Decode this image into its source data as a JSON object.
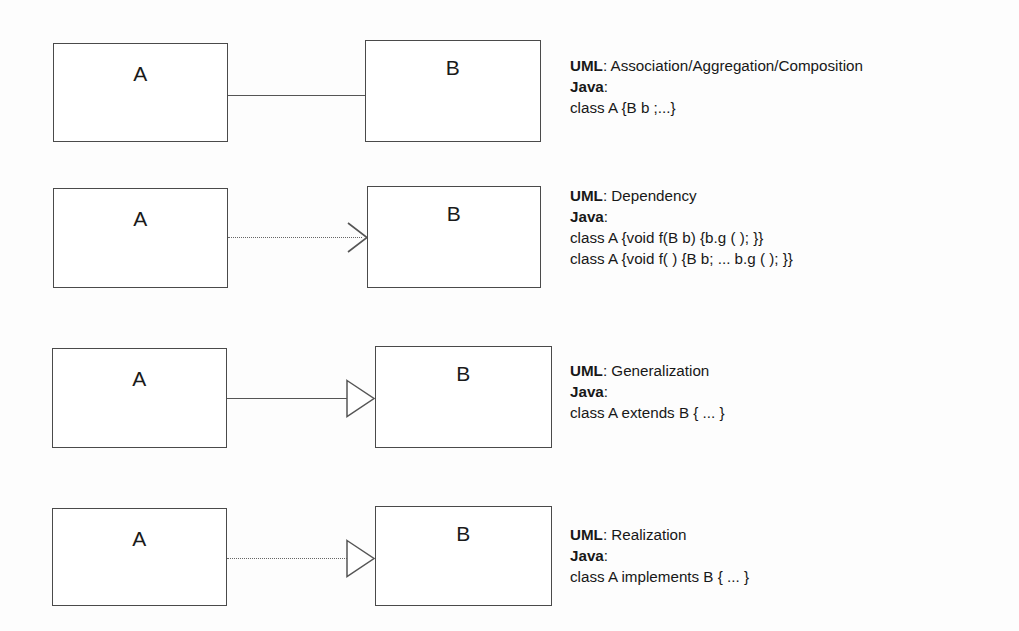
{
  "diagram": {
    "type": "uml-class-relationship-reference",
    "class_names": {
      "source": "A",
      "target": "B"
    },
    "rows": [
      {
        "id": "association",
        "source_label": "A",
        "target_label": "B",
        "connector": {
          "style": "solid",
          "arrowhead": "none"
        },
        "annotation": {
          "uml_key": "UML",
          "uml_sep": ": ",
          "uml_value": "Association/Aggregation/Composition",
          "java_key": "Java",
          "java_sep": ":",
          "code_lines": [
            "class A {B b ;...}"
          ]
        }
      },
      {
        "id": "dependency",
        "source_label": "A",
        "target_label": "B",
        "connector": {
          "style": "dotted",
          "arrowhead": "open"
        },
        "annotation": {
          "uml_key": "UML",
          "uml_sep": ": ",
          "uml_value": "Dependency",
          "java_key": "Java",
          "java_sep": ":",
          "code_lines": [
            "class A {void f(B b) {b.g ( ); }}",
            "class A {void f( ) {B b; ... b.g ( ); }}"
          ]
        }
      },
      {
        "id": "generalization",
        "source_label": "A",
        "target_label": "B",
        "connector": {
          "style": "solid",
          "arrowhead": "hollow-triangle"
        },
        "annotation": {
          "uml_key": "UML",
          "uml_sep": ": ",
          "uml_value": "Generalization",
          "java_key": "Java",
          "java_sep": ":",
          "code_lines": [
            "class A extends B { ... }"
          ]
        }
      },
      {
        "id": "realization",
        "source_label": "A",
        "target_label": "B",
        "connector": {
          "style": "dotted",
          "arrowhead": "hollow-triangle"
        },
        "annotation": {
          "uml_key": "UML",
          "uml_sep": ": ",
          "uml_value": "Realization",
          "java_key": "Java",
          "java_sep": ":",
          "code_lines": [
            "class A implements B { ... }"
          ]
        }
      }
    ],
    "colors": {
      "background": "#fdfdfd",
      "box_stroke": "#4a4a4a",
      "line_stroke": "#555555",
      "text": "#181818"
    }
  }
}
